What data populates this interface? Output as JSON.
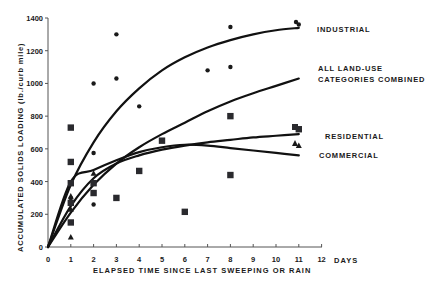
{
  "chart_data": {
    "type": "scatter",
    "title": "",
    "xlabel": "ELAPSED TIME SINCE LAST SWEEPING OR RAIN",
    "xunit_label": "DAYS",
    "ylabel": "ACCUMULATED SOLIDS LOADING (lb./curb mile)",
    "xlim": [
      0,
      12
    ],
    "ylim": [
      0,
      1400
    ],
    "xticks": [
      "0",
      "1",
      "2",
      "3",
      "4",
      "5",
      "6",
      "7",
      "8",
      "9",
      "10",
      "11",
      "12"
    ],
    "yticks": [
      "0",
      "200",
      "400",
      "600",
      "800",
      "1000",
      "1200",
      "1400"
    ],
    "grid": false,
    "series": [
      {
        "name": "INDUSTRIAL",
        "marker": "circle",
        "points": [
          [
            1,
            300
          ],
          [
            2,
            575
          ],
          [
            2,
            1000
          ],
          [
            2,
            260
          ],
          [
            3,
            1300
          ],
          [
            3,
            1030
          ],
          [
            4,
            860
          ],
          [
            7,
            1080
          ],
          [
            8,
            1345
          ],
          [
            8,
            1100
          ],
          [
            11,
            1360
          ]
        ],
        "curve": [
          [
            0,
            0
          ],
          [
            1,
            380
          ],
          [
            2,
            640
          ],
          [
            3,
            830
          ],
          [
            4,
            970
          ],
          [
            5,
            1080
          ],
          [
            6,
            1160
          ],
          [
            7,
            1220
          ],
          [
            8,
            1265
          ],
          [
            9,
            1300
          ],
          [
            10,
            1325
          ],
          [
            11,
            1340
          ]
        ]
      },
      {
        "name": "ALL LAND-USE CATEGORIES COMBINED",
        "marker": "none",
        "curve": [
          [
            0,
            0
          ],
          [
            1,
            210
          ],
          [
            2,
            380
          ],
          [
            3,
            510
          ],
          [
            4,
            610
          ],
          [
            5,
            690
          ],
          [
            6,
            760
          ],
          [
            7,
            830
          ],
          [
            8,
            890
          ],
          [
            9,
            940
          ],
          [
            10,
            985
          ],
          [
            11,
            1030
          ]
        ]
      },
      {
        "name": "RESIDENTIAL",
        "marker": "square",
        "points": [
          [
            1,
            730
          ],
          [
            1,
            520
          ],
          [
            1,
            390
          ],
          [
            1,
            270
          ],
          [
            1,
            150
          ],
          [
            2,
            390
          ],
          [
            2,
            330
          ],
          [
            3,
            300
          ],
          [
            4,
            465
          ],
          [
            5,
            650
          ],
          [
            6,
            215
          ],
          [
            8,
            800
          ],
          [
            8,
            440
          ],
          [
            11,
            720
          ]
        ],
        "curve": [
          [
            0,
            0
          ],
          [
            1,
            250
          ],
          [
            2,
            420
          ],
          [
            3,
            510
          ],
          [
            4,
            560
          ],
          [
            5,
            595
          ],
          [
            6,
            620
          ],
          [
            7,
            640
          ],
          [
            8,
            655
          ],
          [
            9,
            670
          ],
          [
            10,
            680
          ],
          [
            11,
            690
          ]
        ]
      },
      {
        "name": "COMMERCIAL",
        "marker": "triangle",
        "points": [
          [
            1,
            310
          ],
          [
            1,
            60
          ],
          [
            1,
            230
          ],
          [
            2,
            450
          ],
          [
            11,
            620
          ]
        ],
        "curve": [
          [
            0,
            0
          ],
          [
            1,
            400
          ],
          [
            2,
            470
          ],
          [
            3,
            530
          ],
          [
            4,
            580
          ],
          [
            5,
            610
          ],
          [
            6,
            625
          ],
          [
            7,
            620
          ],
          [
            8,
            605
          ],
          [
            9,
            590
          ],
          [
            10,
            575
          ],
          [
            11,
            560
          ]
        ]
      }
    ],
    "legend_position": "inline labels at right end of curves"
  },
  "labels": {
    "industrial": "INDUSTRIAL",
    "combined_1": "ALL LAND-USE",
    "combined_2": "CATEGORIES COMBINED",
    "residential": "RESIDENTIAL",
    "commercial": "COMMERCIAL",
    "xlabel": "ELAPSED TIME SINCE LAST SWEEPING OR RAIN",
    "days": "DAYS",
    "ylabel": "ACCUMULATED SOLIDS LOADING (lb./curb mile)"
  }
}
